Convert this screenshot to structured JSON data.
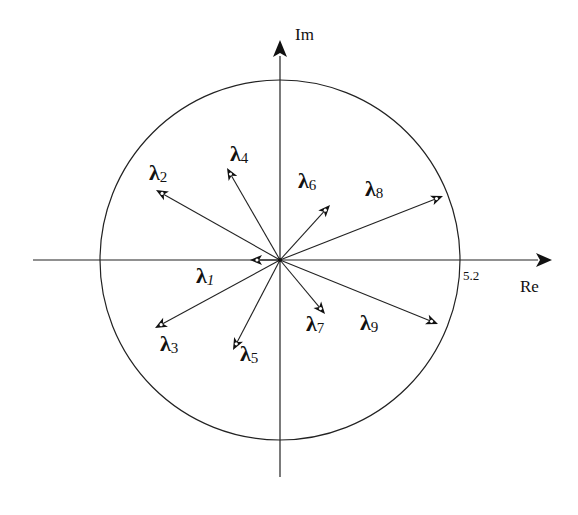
{
  "diagram": {
    "axes": {
      "real_label": "Re",
      "imag_label": "Im",
      "radius_label": "5.2"
    },
    "origin": {
      "x": 280,
      "y": 260
    },
    "circle_radius_px": 180,
    "colors": {
      "stroke": "#222222",
      "background": "#ffffff"
    },
    "vectors": [
      {
        "name": "λ1",
        "symbol": "λ",
        "sub": "1",
        "italic_sub": true,
        "tip": [
          250,
          260
        ],
        "label_pos": [
          196,
          265
        ]
      },
      {
        "name": "λ2",
        "symbol": "λ",
        "sub": "2",
        "italic_sub": false,
        "tip": [
          156,
          190
        ],
        "label_pos": [
          149,
          162
        ]
      },
      {
        "name": "λ3",
        "symbol": "λ",
        "sub": "3",
        "italic_sub": false,
        "tip": [
          155,
          328
        ],
        "label_pos": [
          160,
          333
        ]
      },
      {
        "name": "λ4",
        "symbol": "λ",
        "sub": "4",
        "italic_sub": false,
        "tip": [
          227,
          168
        ],
        "label_pos": [
          230,
          143
        ]
      },
      {
        "name": "λ5",
        "symbol": "λ",
        "sub": "5",
        "italic_sub": false,
        "tip": [
          233,
          350
        ],
        "label_pos": [
          240,
          343
        ]
      },
      {
        "name": "λ6",
        "symbol": "λ",
        "sub": "6",
        "italic_sub": false,
        "tip": [
          330,
          205
        ],
        "label_pos": [
          298,
          170
        ]
      },
      {
        "name": "λ7",
        "symbol": "λ",
        "sub": "7",
        "italic_sub": false,
        "tip": [
          325,
          314
        ],
        "label_pos": [
          306,
          313
        ]
      },
      {
        "name": "λ8",
        "symbol": "λ",
        "sub": "8",
        "italic_sub": false,
        "tip": [
          443,
          196
        ],
        "label_pos": [
          365,
          178
        ]
      },
      {
        "name": "λ9",
        "symbol": "λ",
        "sub": "9",
        "italic_sub": false,
        "tip": [
          438,
          324
        ],
        "label_pos": [
          360,
          312
        ]
      }
    ]
  }
}
